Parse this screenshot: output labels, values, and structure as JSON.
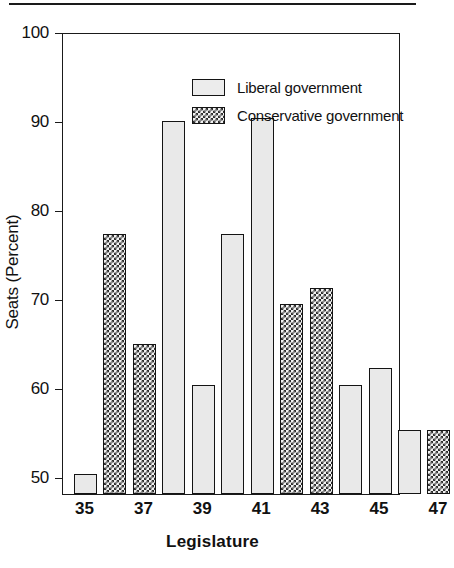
{
  "chart_data": {
    "type": "bar",
    "title": "",
    "xlabel": "Legislature",
    "ylabel": "Seats (Percent)",
    "ylim": [
      48,
      100
    ],
    "yticks": [
      50,
      60,
      70,
      80,
      90,
      100
    ],
    "ytick_labels": [
      "50",
      "60",
      "70",
      "80",
      "90",
      "100"
    ],
    "xtick_labels": [
      "35",
      "37",
      "39",
      "41",
      "43",
      "45",
      "47"
    ],
    "grid": false,
    "legend_position": "top-left-inside",
    "categories": [
      "35",
      "36",
      "37",
      "38",
      "39",
      "40",
      "41",
      "42",
      "43",
      "44",
      "45",
      "46",
      "47"
    ],
    "values": [
      50.3,
      77.3,
      65.0,
      90.0,
      60.3,
      77.3,
      90.3,
      69.4,
      71.2,
      60.3,
      62.3,
      55.3,
      55.3
    ],
    "series": [
      {
        "name": "Liberal government",
        "fill": "light-stipple",
        "color": "#e9e9e9",
        "points": [
          {
            "category": "35",
            "value": 50.3
          },
          {
            "category": "38",
            "value": 90.0
          },
          {
            "category": "39",
            "value": 60.3
          },
          {
            "category": "40",
            "value": 77.3
          },
          {
            "category": "41",
            "value": 90.3
          },
          {
            "category": "44",
            "value": 60.3
          },
          {
            "category": "45",
            "value": 62.3
          },
          {
            "category": "46",
            "value": 55.3
          }
        ]
      },
      {
        "name": "Conservative government",
        "fill": "dark-checker",
        "color": "#2e2e2e",
        "points": [
          {
            "category": "36",
            "value": 77.3
          },
          {
            "category": "37",
            "value": 65.0
          },
          {
            "category": "42",
            "value": 69.4
          },
          {
            "category": "43",
            "value": 71.2
          },
          {
            "category": "47",
            "value": 55.3
          }
        ]
      }
    ],
    "bars": [
      {
        "category": "35",
        "value": 50.3,
        "party": "liberal"
      },
      {
        "category": "36",
        "value": 77.3,
        "party": "conservative"
      },
      {
        "category": "37",
        "value": 65.0,
        "party": "conservative"
      },
      {
        "category": "38",
        "value": 90.0,
        "party": "liberal"
      },
      {
        "category": "39",
        "value": 60.3,
        "party": "liberal"
      },
      {
        "category": "40",
        "value": 77.3,
        "party": "liberal"
      },
      {
        "category": "41",
        "value": 90.3,
        "party": "liberal"
      },
      {
        "category": "42",
        "value": 69.4,
        "party": "conservative"
      },
      {
        "category": "43",
        "value": 71.2,
        "party": "conservative"
      },
      {
        "category": "44",
        "value": 60.3,
        "party": "liberal"
      },
      {
        "category": "45",
        "value": 62.3,
        "party": "liberal"
      },
      {
        "category": "46",
        "value": 55.3,
        "party": "liberal"
      },
      {
        "category": "47",
        "value": 55.3,
        "party": "conservative"
      }
    ]
  },
  "legend": {
    "items": [
      {
        "label": "Liberal government",
        "party": "liberal"
      },
      {
        "label": "Conservative government",
        "party": "conservative"
      }
    ]
  }
}
